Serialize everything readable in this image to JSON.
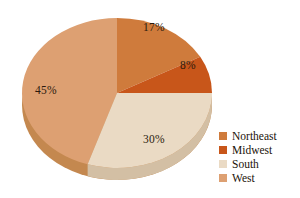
{
  "chart_data": {
    "type": "pie",
    "title": "",
    "subtitle": "",
    "xlabel": "",
    "ylabel": "",
    "grid": false,
    "legend_position": "right",
    "three_d": true,
    "start_angle_deg": 0,
    "direction": "clockwise",
    "categories": [
      "Northeast",
      "Midwest",
      "South",
      "West"
    ],
    "values": [
      17,
      8,
      30,
      45
    ],
    "value_unit": "%",
    "data_labels": [
      "17%",
      "8%",
      "30%",
      "45%"
    ],
    "slice_colors": [
      "#cf7b3c",
      "#c8561a",
      "#eadac4",
      "#dda072"
    ],
    "slice_side_colors": [
      "#b2652c",
      "#a8450f",
      "#d3bfa4",
      "#c4884f"
    ],
    "slices": [
      {
        "label": "Northeast",
        "value": 17,
        "data_label": "17%",
        "color": "#cf7b3c"
      },
      {
        "label": "Midwest",
        "value": 8,
        "data_label": "8%",
        "color": "#c8561a"
      },
      {
        "label": "South",
        "value": 30,
        "data_label": "30%",
        "color": "#eadac4"
      },
      {
        "label": "West",
        "value": 45,
        "data_label": "45%",
        "color": "#dda072"
      }
    ]
  },
  "legend": {
    "items": [
      {
        "label": "Northeast",
        "color": "#cf7b3c"
      },
      {
        "label": "Midwest",
        "color": "#c8561a"
      },
      {
        "label": "South",
        "color": "#eadac4"
      },
      {
        "label": "West",
        "color": "#dda072"
      }
    ]
  },
  "labels": {
    "northeast_pct": "17%",
    "midwest_pct": "8%",
    "south_pct": "30%",
    "west_pct": "45%"
  },
  "colors": {
    "background": "#ffffff",
    "label_text": "#2b1a0e",
    "legend_text": "#1b1208"
  }
}
